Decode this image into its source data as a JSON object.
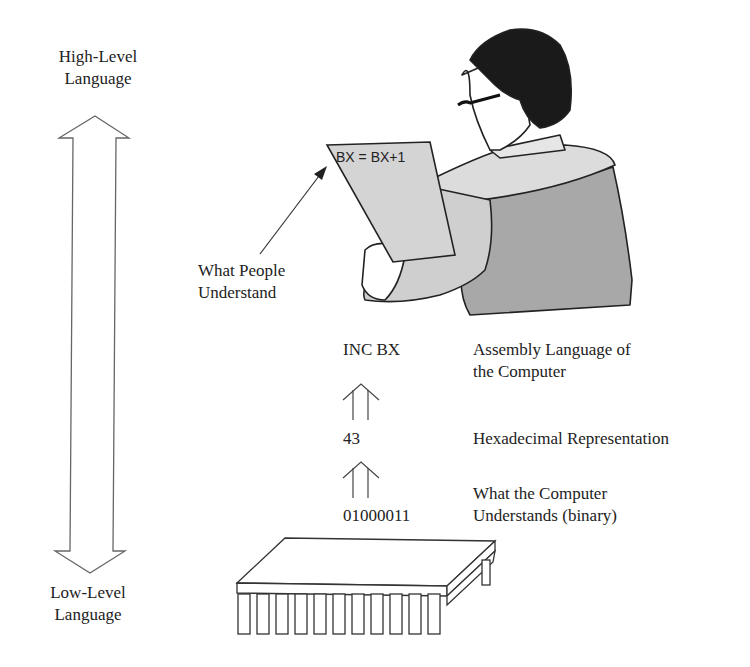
{
  "scale": {
    "top_label": [
      "High-Level",
      "Language"
    ],
    "bottom_label": [
      "Low-Level",
      "Language"
    ]
  },
  "figure": {
    "paper_text": "BX = BX+1",
    "pointer_label": [
      "What People",
      "Understand"
    ]
  },
  "levels": [
    {
      "code": "INC BX",
      "description": [
        "Assembly Language of",
        "the Computer"
      ]
    },
    {
      "code": "43",
      "description": [
        "Hexadecimal Representation"
      ]
    },
    {
      "code": "01000011",
      "description": [
        "What the Computer",
        "Understands (binary)"
      ]
    }
  ],
  "colors": {
    "line": "#555555",
    "shirt_light": "#d9d9d9",
    "shirt_dark": "#a8a8a8",
    "paper": "#d4d4d4",
    "hair": "#1a1a1a"
  }
}
